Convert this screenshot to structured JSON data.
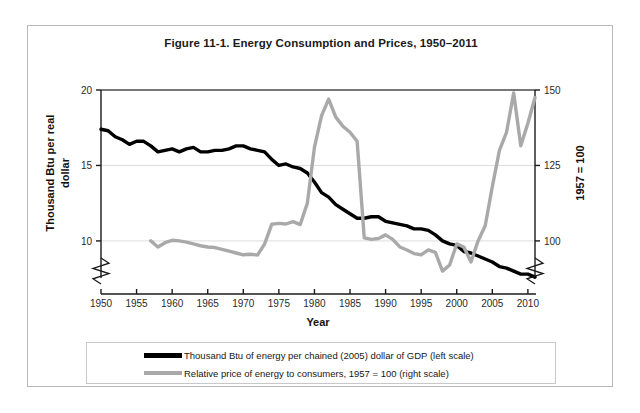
{
  "figure": {
    "title": "Figure 11-1. Energy Consumption and Prices, 1950–2011"
  },
  "legend": {
    "items": [
      {
        "label": "Thousand Btu of energy per chained (2005) dollar of GDP (left scale)",
        "color": "#000000",
        "swatch": "thick"
      },
      {
        "label": "Relative price of energy to consumers, 1957 = 100 (right scale)",
        "color": "#a9a9a9",
        "swatch": "thin"
      }
    ]
  },
  "chart_data": {
    "type": "line",
    "title": "Figure 11-1. Energy Consumption and Prices, 1950–2011",
    "xlabel": "Year",
    "ylabel": "Thousand Btu per real dollar",
    "y2label": "1957 = 100",
    "xlim": [
      1950,
      2011
    ],
    "ylim": [
      9,
      20
    ],
    "y2lim": [
      95,
      150
    ],
    "xticks": [
      1950,
      1955,
      1960,
      1965,
      1970,
      1975,
      1980,
      1985,
      1990,
      1995,
      2000,
      2005,
      2010
    ],
    "yticks": [
      10,
      15,
      20
    ],
    "y2ticks": [
      100,
      125,
      150
    ],
    "grid": "horizontal",
    "axis_break": true,
    "legend_position": "bottom",
    "series": [
      {
        "name": "Thousand Btu of energy per chained (2005) dollar of GDP (left scale)",
        "axis": "left",
        "color": "#000000",
        "width": 3.4,
        "x": [
          1950,
          1951,
          1952,
          1953,
          1954,
          1955,
          1956,
          1957,
          1958,
          1959,
          1960,
          1961,
          1962,
          1963,
          1964,
          1965,
          1966,
          1967,
          1968,
          1969,
          1970,
          1971,
          1972,
          1973,
          1974,
          1975,
          1976,
          1977,
          1978,
          1979,
          1980,
          1981,
          1982,
          1983,
          1984,
          1985,
          1986,
          1987,
          1988,
          1989,
          1990,
          1991,
          1992,
          1993,
          1994,
          1995,
          1996,
          1997,
          1998,
          1999,
          2000,
          2001,
          2002,
          2003,
          2004,
          2005,
          2006,
          2007,
          2008,
          2009,
          2010,
          2011
        ],
        "y": [
          17.4,
          17.3,
          16.9,
          16.7,
          16.4,
          16.6,
          16.6,
          16.3,
          15.9,
          16.0,
          16.1,
          15.9,
          16.1,
          16.2,
          15.9,
          15.9,
          16.0,
          16.0,
          16.1,
          16.3,
          16.3,
          16.1,
          16.0,
          15.9,
          15.4,
          15.0,
          15.1,
          14.9,
          14.8,
          14.5,
          13.9,
          13.2,
          12.9,
          12.4,
          12.1,
          11.8,
          11.5,
          11.5,
          11.6,
          11.6,
          11.3,
          11.2,
          11.1,
          11.0,
          10.8,
          10.8,
          10.7,
          10.4,
          10.0,
          9.8,
          9.7,
          9.3,
          9.2,
          9.0,
          8.8,
          8.6,
          8.3,
          8.2,
          8.0,
          7.8,
          7.8,
          7.6
        ]
      },
      {
        "name": "Relative price of energy to consumers, 1957 = 100 (right scale)",
        "axis": "right",
        "color": "#a9a9a9",
        "width": 3.4,
        "x": [
          1957,
          1958,
          1959,
          1960,
          1961,
          1962,
          1963,
          1964,
          1965,
          1966,
          1967,
          1968,
          1969,
          1970,
          1971,
          1972,
          1973,
          1974,
          1975,
          1976,
          1977,
          1978,
          1979,
          1980,
          1981,
          1982,
          1983,
          1984,
          1985,
          1986,
          1987,
          1988,
          1989,
          1990,
          1991,
          1992,
          1993,
          1994,
          1995,
          1996,
          1997,
          1998,
          1999,
          2000,
          2001,
          2002,
          2003,
          2004,
          2005,
          2006,
          2007,
          2008,
          2009,
          2010,
          2011
        ],
        "y": [
          100.0,
          98.0,
          99.4,
          100.2,
          100.0,
          99.6,
          99.0,
          98.4,
          98.0,
          97.8,
          97.2,
          96.6,
          96.0,
          95.4,
          95.6,
          95.3,
          99.0,
          105.5,
          105.8,
          105.6,
          106.4,
          105.4,
          112.5,
          131.0,
          141.5,
          147.0,
          141.0,
          138.0,
          136.0,
          133.0,
          101.0,
          100.5,
          100.8,
          102.0,
          100.5,
          98.0,
          97.0,
          95.8,
          95.4,
          97.0,
          96.2,
          90.0,
          92.0,
          99.0,
          98.0,
          93.0,
          100.0,
          105.0,
          118.0,
          130.0,
          136.0,
          149.0,
          131.5,
          139.0,
          147.5
        ]
      }
    ]
  }
}
